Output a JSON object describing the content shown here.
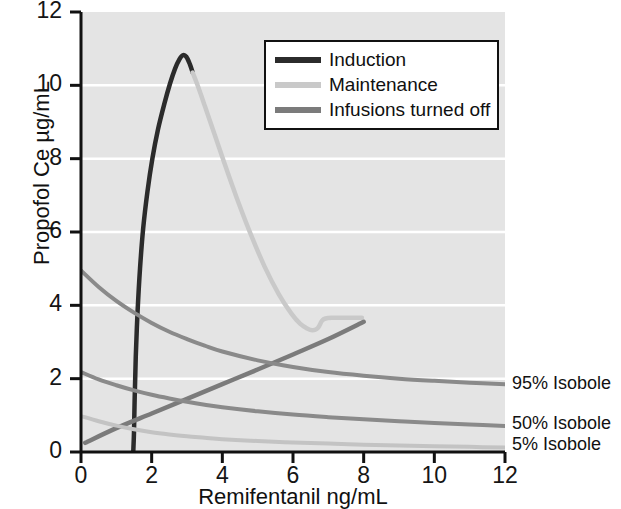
{
  "chart_data": {
    "type": "line",
    "title": "",
    "xlabel": "Remifentanil ng/mL",
    "ylabel": "Propofol Ce µg/mL",
    "xlim": [
      0,
      12
    ],
    "ylim": [
      0,
      12
    ],
    "xticks": [
      "0",
      "2",
      "4",
      "6",
      "8",
      "10",
      "12"
    ],
    "yticks": [
      "0",
      "2",
      "4",
      "6",
      "8",
      "10",
      "12"
    ],
    "grid": "horizontal-white-gridlines",
    "legend_position": "top-right-inside",
    "plot_background": "#e4e4e4",
    "series": [
      {
        "name": "Induction",
        "color": "#2b2b2b",
        "width": 4.5,
        "points": [
          [
            1.48,
            0.02
          ],
          [
            1.5,
            0.55
          ],
          [
            1.52,
            1.5
          ],
          [
            1.55,
            2.6
          ],
          [
            1.6,
            3.8
          ],
          [
            1.67,
            5.0
          ],
          [
            1.76,
            6.1
          ],
          [
            1.88,
            7.1
          ],
          [
            2.02,
            8.0
          ],
          [
            2.18,
            8.8
          ],
          [
            2.36,
            9.5
          ],
          [
            2.52,
            10.05
          ],
          [
            2.66,
            10.45
          ],
          [
            2.78,
            10.7
          ],
          [
            2.88,
            10.82
          ],
          [
            2.98,
            10.78
          ],
          [
            3.08,
            10.58
          ],
          [
            3.16,
            10.35
          ]
        ]
      },
      {
        "name": "Maintenance",
        "color": "#c9c9c9",
        "width": 4.5,
        "points": [
          [
            3.16,
            10.35
          ],
          [
            3.3,
            10.0
          ],
          [
            3.5,
            9.45
          ],
          [
            3.75,
            8.75
          ],
          [
            4.05,
            7.9
          ],
          [
            4.4,
            6.95
          ],
          [
            4.8,
            5.95
          ],
          [
            5.2,
            5.05
          ],
          [
            5.6,
            4.3
          ],
          [
            5.95,
            3.78
          ],
          [
            6.2,
            3.5
          ],
          [
            6.4,
            3.37
          ],
          [
            6.55,
            3.32
          ],
          [
            6.68,
            3.36
          ],
          [
            6.76,
            3.47
          ],
          [
            6.82,
            3.58
          ],
          [
            6.92,
            3.64
          ],
          [
            7.1,
            3.66
          ],
          [
            7.4,
            3.66
          ],
          [
            7.7,
            3.66
          ],
          [
            7.95,
            3.66
          ]
        ]
      },
      {
        "name": "Infusions turned off",
        "color": "#7b7b7b",
        "width": 4.5,
        "points": [
          [
            0.12,
            0.25
          ],
          [
            1.0,
            0.65
          ],
          [
            2.0,
            1.05
          ],
          [
            3.0,
            1.45
          ],
          [
            4.0,
            1.85
          ],
          [
            5.0,
            2.25
          ],
          [
            6.0,
            2.66
          ],
          [
            7.0,
            3.08
          ],
          [
            8.0,
            3.55
          ]
        ]
      },
      {
        "name": "95% Isobole",
        "color": "#8a8a8a",
        "width": 4.0,
        "points": [
          [
            0.0,
            4.95
          ],
          [
            0.5,
            4.5
          ],
          [
            1.0,
            4.12
          ],
          [
            1.5,
            3.8
          ],
          [
            2.0,
            3.52
          ],
          [
            2.5,
            3.28
          ],
          [
            3.0,
            3.08
          ],
          [
            3.5,
            2.9
          ],
          [
            4.0,
            2.74
          ],
          [
            5.0,
            2.5
          ],
          [
            6.0,
            2.32
          ],
          [
            7.0,
            2.18
          ],
          [
            8.0,
            2.08
          ],
          [
            9.0,
            2.0
          ],
          [
            10.0,
            1.94
          ],
          [
            11.0,
            1.89
          ],
          [
            12.0,
            1.85
          ]
        ]
      },
      {
        "name": "50% Isobole",
        "color": "#8a8a8a",
        "width": 4.0,
        "points": [
          [
            0.0,
            2.18
          ],
          [
            0.5,
            1.98
          ],
          [
            1.0,
            1.82
          ],
          [
            1.5,
            1.68
          ],
          [
            2.0,
            1.56
          ],
          [
            2.5,
            1.46
          ],
          [
            3.0,
            1.37
          ],
          [
            3.5,
            1.29
          ],
          [
            4.0,
            1.22
          ],
          [
            5.0,
            1.11
          ],
          [
            6.0,
            1.02
          ],
          [
            7.0,
            0.95
          ],
          [
            8.0,
            0.89
          ],
          [
            9.0,
            0.84
          ],
          [
            10.0,
            0.79
          ],
          [
            11.0,
            0.75
          ],
          [
            12.0,
            0.71
          ]
        ]
      },
      {
        "name": "5% Isobole",
        "color": "#c3c3c3",
        "width": 4.0,
        "points": [
          [
            0.0,
            0.98
          ],
          [
            0.5,
            0.84
          ],
          [
            1.0,
            0.72
          ],
          [
            1.5,
            0.62
          ],
          [
            2.0,
            0.54
          ],
          [
            2.5,
            0.48
          ],
          [
            3.0,
            0.43
          ],
          [
            3.5,
            0.39
          ],
          [
            4.0,
            0.35
          ],
          [
            5.0,
            0.3
          ],
          [
            6.0,
            0.26
          ],
          [
            7.0,
            0.23
          ],
          [
            8.0,
            0.2
          ],
          [
            9.0,
            0.18
          ],
          [
            10.0,
            0.16
          ],
          [
            11.0,
            0.14
          ],
          [
            12.0,
            0.12
          ]
        ]
      }
    ],
    "annotations": [
      {
        "text": "95% Isobole",
        "x": 12.0,
        "y": 1.85
      },
      {
        "text": "50% Isobole",
        "x": 12.0,
        "y": 0.71
      },
      {
        "text": "5% Isobole",
        "x": 12.0,
        "y": 0.12
      }
    ]
  },
  "axes": {
    "ylabel": "Propofol Ce µg/mL",
    "xlabel": "Remifentanil ng/mL",
    "xticks": [
      "0",
      "2",
      "4",
      "6",
      "8",
      "10",
      "12"
    ],
    "yticks": [
      "0",
      "2",
      "4",
      "6",
      "8",
      "10",
      "12"
    ]
  },
  "legend": {
    "items": [
      {
        "label": "Induction",
        "color": "#2b2b2b"
      },
      {
        "label": "Maintenance",
        "color": "#c9c9c9"
      },
      {
        "label": "Infusions turned off",
        "color": "#7b7b7b"
      }
    ]
  },
  "isobole_labels": [
    {
      "label": "95% Isobole"
    },
    {
      "label": "50% Isobole"
    },
    {
      "label": "5% Isobole"
    }
  ]
}
